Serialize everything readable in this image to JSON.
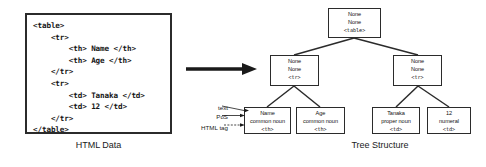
{
  "figure": {
    "left_panel": {
      "caption": "HTML Data",
      "code": "<table>\n    <tr>\n        <th> Name </th>\n        <th> Age </th>\n    </tr>\n    <tr>\n        <td> Tanaka </td>\n        <td> 12 </td>\n    </tr>\n</table>"
    },
    "arrow": {
      "icon": "right-arrow-icon",
      "direction": "right"
    },
    "right_panel": {
      "caption": "Tree Structure",
      "annotations": [
        {
          "id": "text",
          "label": "text"
        },
        {
          "id": "pos",
          "label": "PoS"
        },
        {
          "id": "html_tag",
          "label": "HTML tag"
        }
      ],
      "nodes": [
        {
          "id": "table",
          "text": "None",
          "pos": "None",
          "tag": "<table>"
        },
        {
          "id": "tr1",
          "text": "None",
          "pos": "None",
          "tag": "<tr>"
        },
        {
          "id": "tr2",
          "text": "None",
          "pos": "None",
          "tag": "<tr>"
        },
        {
          "id": "th_name",
          "text": "Name",
          "pos": "common noun",
          "tag": "<th>"
        },
        {
          "id": "th_age",
          "text": "Age",
          "pos": "common noun",
          "tag": "<th>"
        },
        {
          "id": "td_tanaka",
          "text": "Tanaka",
          "pos": "proper noun",
          "tag": "<td>"
        },
        {
          "id": "td_12",
          "text": "12",
          "pos": "numeral",
          "tag": "<td>"
        }
      ]
    }
  }
}
